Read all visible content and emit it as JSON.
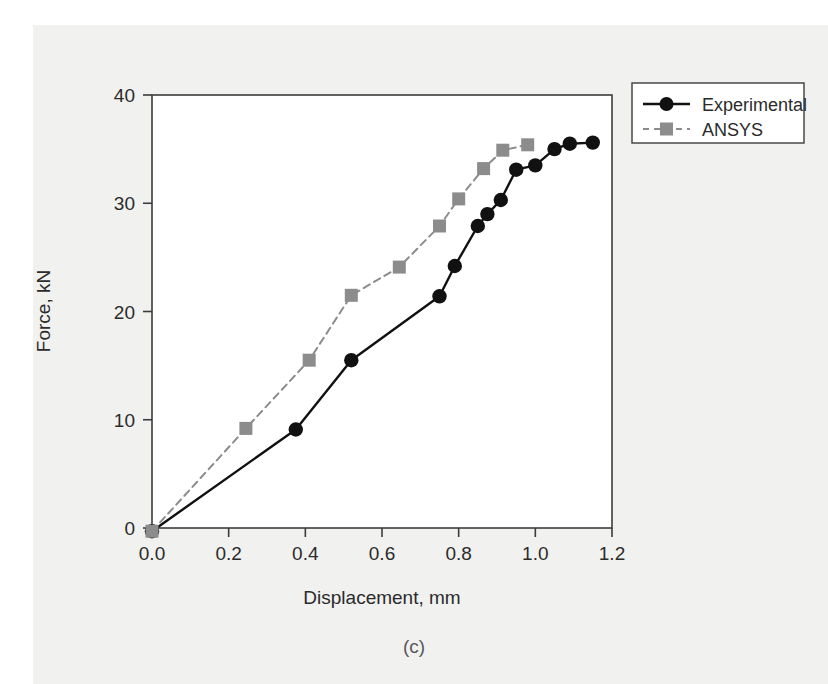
{
  "figure": {
    "caption": "(c)",
    "background_color": "#f1f1ef",
    "plot_background_color": "#ffffff",
    "axis_color": "#3c3c3c"
  },
  "chart_data": {
    "type": "line",
    "title": "",
    "xlabel": "Displacement, mm",
    "ylabel": "Force, kN",
    "xlim": [
      -0.04,
      1.26
    ],
    "ylim": [
      -2.6,
      41.5
    ],
    "xticks": [
      0.0,
      0.2,
      0.4,
      0.6,
      0.8,
      1.0,
      1.2
    ],
    "xticklabels": [
      "0.0",
      "0.2",
      "0.4",
      "0.6",
      "0.8",
      "1.0",
      "1.2"
    ],
    "yticks": [
      0,
      10,
      20,
      30,
      40
    ],
    "yticklabels": [
      "0",
      "10",
      "20",
      "30",
      "40"
    ],
    "grid": false,
    "legend_position": "outside top right",
    "series": [
      {
        "name": "Experimental",
        "color": "#111111",
        "marker": "circle",
        "linestyle": "solid",
        "x": [
          0.0,
          0.375,
          0.52,
          0.75,
          0.79,
          0.85,
          0.875,
          0.91,
          0.95,
          1.0,
          1.05,
          1.09,
          1.15
        ],
        "y": [
          -0.3,
          9.1,
          15.5,
          21.4,
          24.2,
          27.9,
          29.0,
          30.3,
          33.1,
          33.5,
          35.0,
          35.5,
          35.6
        ]
      },
      {
        "name": "ANSYS",
        "color": "#8c8c8c",
        "marker": "square",
        "linestyle": "dashed",
        "x": [
          0.0,
          0.245,
          0.41,
          0.52,
          0.645,
          0.75,
          0.8,
          0.865,
          0.915,
          0.98
        ],
        "y": [
          -0.3,
          9.2,
          15.5,
          21.5,
          24.1,
          27.9,
          30.4,
          33.2,
          34.9,
          35.4
        ]
      }
    ]
  },
  "legend": {
    "entries": [
      {
        "label": "Experimental",
        "color": "#111111",
        "marker": "circle",
        "linestyle": "solid"
      },
      {
        "label": "ANSYS",
        "color": "#8c8c8c",
        "marker": "square",
        "linestyle": "dashed"
      }
    ]
  }
}
